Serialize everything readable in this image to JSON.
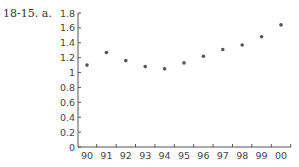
{
  "problem_label": "18-15.  a.",
  "chart_data": {
    "type": "scatter",
    "title": "",
    "xlabel": "",
    "ylabel": "",
    "categories": [
      "90",
      "91",
      "92",
      "93",
      "94",
      "95",
      "96",
      "97",
      "98",
      "99",
      "00"
    ],
    "values": [
      1.1,
      1.27,
      1.16,
      1.08,
      1.05,
      1.13,
      1.22,
      1.31,
      1.37,
      1.48,
      1.64
    ],
    "ylim": [
      0,
      1.8
    ],
    "yticks": [
      "0",
      "0.2",
      "0.4",
      "0.6",
      "0.8",
      "1",
      "1.2",
      "1.4",
      "1.6",
      "1.8"
    ],
    "grid": false,
    "legend": null,
    "marker_color": "#555555"
  }
}
